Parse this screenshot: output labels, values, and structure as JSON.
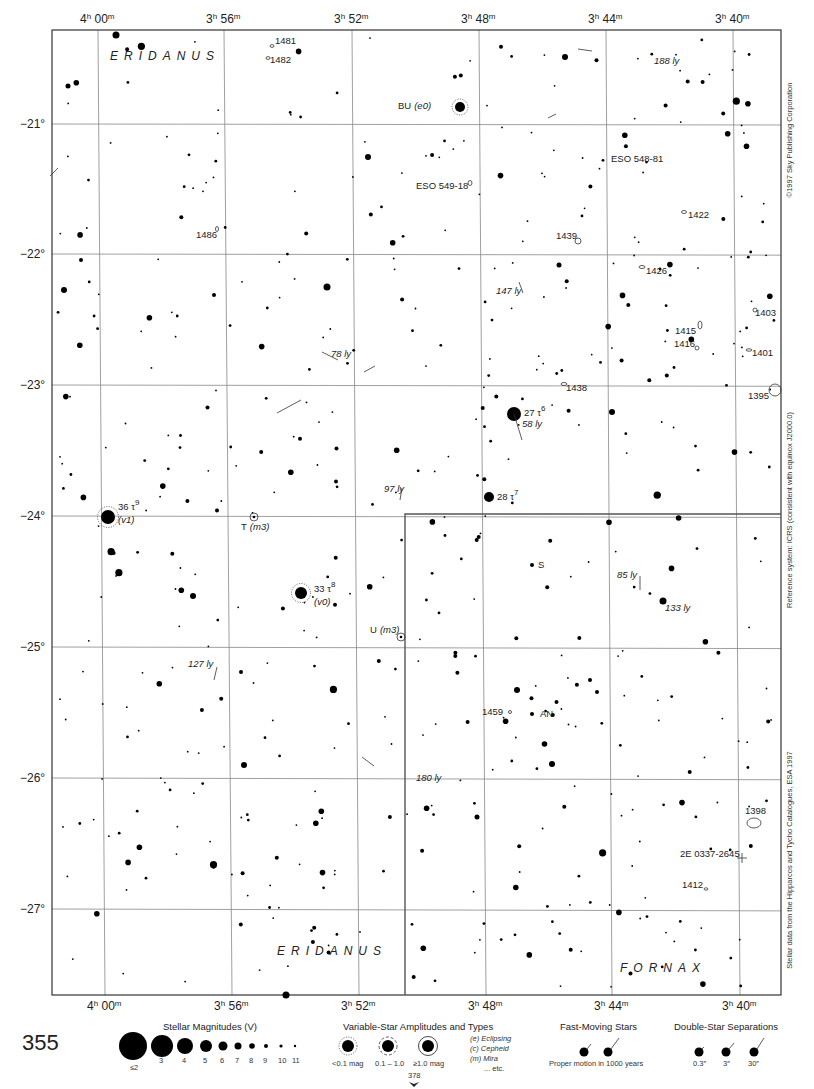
{
  "chart": {
    "page_number": "355",
    "next_page_ref": "378",
    "frame": {
      "left": 52,
      "top": 30,
      "right": 781,
      "bottom": 995
    },
    "ra_labels": [
      {
        "text_h": "4",
        "text_m": "00",
        "x_top": 98,
        "x_bottom": 105
      },
      {
        "text_h": "3",
        "text_m": "56",
        "x_top": 224,
        "x_bottom": 232
      },
      {
        "text_h": "3",
        "text_m": "52",
        "x_top": 352,
        "x_bottom": 359
      },
      {
        "text_h": "3",
        "text_m": "48",
        "x_top": 479,
        "x_bottom": 486
      },
      {
        "text_h": "3",
        "text_m": "44",
        "x_top": 606,
        "x_bottom": 612
      },
      {
        "text_h": "3",
        "text_m": "40",
        "x_top": 733,
        "x_bottom": 740
      }
    ],
    "dec_labels": [
      {
        "text": "−21°",
        "y": 124
      },
      {
        "text": "−22°",
        "y": 254
      },
      {
        "text": "−23°",
        "y": 385
      },
      {
        "text": "−24°",
        "y": 516
      },
      {
        "text": "−25°",
        "y": 647
      },
      {
        "text": "−26°",
        "y": 778
      },
      {
        "text": "−27°",
        "y": 909
      }
    ],
    "constellations": [
      {
        "name": "ERIDANUS",
        "x": 110,
        "y": 60
      },
      {
        "name": "ERIDANUS",
        "x": 277,
        "y": 955
      },
      {
        "name": "FORNAX",
        "x": 620,
        "y": 972
      }
    ],
    "side_texts": [
      {
        "text": "©1997 Sky Publishing Corporation",
        "x": 792,
        "y": 140
      },
      {
        "text": "Reference system: ICRS (consistent with equinox J2000.0)",
        "x": 792,
        "y": 510
      },
      {
        "text": "Stellar data from the Hipparcos and Tycho Catalogues, ESA 1997",
        "x": 792,
        "y": 860
      }
    ],
    "named_stars": [
      {
        "label": "36 τ",
        "sup": "9",
        "sub_label": "(v1)",
        "x": 108,
        "y": 517,
        "r": 7,
        "variable": "dotted",
        "lx": 118,
        "ly": 510
      },
      {
        "label": "33 τ",
        "sup": "8",
        "sub_label": "(v0)",
        "x": 301,
        "y": 593,
        "r": 6,
        "variable": "dotted",
        "lx": 314,
        "ly": 592
      },
      {
        "label": "27 τ",
        "sup": "6",
        "sub_label": "",
        "x": 514,
        "y": 414,
        "r": 7,
        "variable": "none",
        "lx": 524,
        "ly": 416
      },
      {
        "label": "28 τ",
        "sup": "7",
        "sub_label": "",
        "x": 489,
        "y": 497,
        "r": 5,
        "variable": "none",
        "lx": 497,
        "ly": 500
      }
    ],
    "variable_labels": [
      {
        "text": "BU",
        "type": "(e0)",
        "x": 398,
        "y": 109
      },
      {
        "text": "T",
        "type": "(m3)",
        "x": 241,
        "y": 530
      },
      {
        "text": "U",
        "type": "(m3)",
        "x": 370,
        "y": 633
      },
      {
        "text": "S",
        "type": "",
        "x": 538,
        "y": 568
      },
      {
        "text": "AN",
        "type": "",
        "x": 540,
        "y": 717
      }
    ],
    "deep_sky": [
      {
        "label": "1481",
        "x": 275,
        "y": 44
      },
      {
        "label": "1482",
        "x": 270,
        "y": 63
      },
      {
        "label": "ESO 549-18",
        "x": 416,
        "y": 189
      },
      {
        "label": "ESO 548-81",
        "x": 611,
        "y": 162
      },
      {
        "label": "1486",
        "x": 196,
        "y": 238
      },
      {
        "label": "1422",
        "x": 688,
        "y": 218
      },
      {
        "label": "1439",
        "x": 556,
        "y": 239
      },
      {
        "label": "1426",
        "x": 646,
        "y": 274
      },
      {
        "label": "1403",
        "x": 755,
        "y": 316
      },
      {
        "label": "1415",
        "x": 675,
        "y": 334
      },
      {
        "label": "1416",
        "x": 674,
        "y": 347
      },
      {
        "label": "1401",
        "x": 752,
        "y": 356
      },
      {
        "label": "1438",
        "x": 566,
        "y": 391
      },
      {
        "label": "1395",
        "x": 748,
        "y": 399
      },
      {
        "label": "1459",
        "x": 482,
        "y": 715
      },
      {
        "label": "1398",
        "x": 745,
        "y": 814
      },
      {
        "label": "2E 0337-2645",
        "x": 680,
        "y": 857
      },
      {
        "label": "1412",
        "x": 682,
        "y": 888
      }
    ],
    "distance_labels": [
      {
        "text": "188 ly",
        "x": 654,
        "y": 64
      },
      {
        "text": "147 ly",
        "x": 496,
        "y": 294
      },
      {
        "text": "78 ly",
        "x": 331,
        "y": 357
      },
      {
        "text": "58 ly",
        "x": 522,
        "y": 427
      },
      {
        "text": "97 ly",
        "x": 384,
        "y": 492
      },
      {
        "text": "85 ly",
        "x": 617,
        "y": 578
      },
      {
        "text": "133 ly",
        "x": 665,
        "y": 611
      },
      {
        "text": "127 ly",
        "x": 188,
        "y": 667
      },
      {
        "text": "180 ly",
        "x": 416,
        "y": 781
      }
    ]
  },
  "legend": {
    "magnitudes": {
      "title": "Stellar Magnitudes (V)",
      "labels": [
        "≤2",
        "3",
        "4",
        "5",
        "6",
        "7",
        "8",
        "9",
        "10",
        "11"
      ]
    },
    "variables": {
      "title": "Variable-Star Amplitudes and Types",
      "amp_labels": [
        "<0.1 mag",
        "0.1 – 1.0",
        "≥1.0 mag"
      ],
      "types": [
        "(e)  Eclipsing",
        "(c)  Cepheid",
        "(m)  Mira",
        "... etc."
      ]
    },
    "fast_moving": {
      "title": "Fast-Moving Stars",
      "caption": "Proper motion in 1000 years"
    },
    "double_stars": {
      "title": "Double-Star Separations",
      "labels": [
        "0.3″",
        "3″",
        "30″"
      ]
    }
  }
}
